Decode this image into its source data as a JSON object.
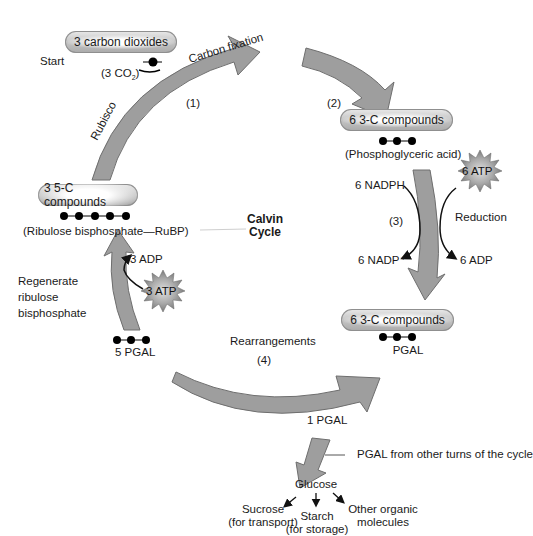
{
  "diagram": {
    "title_lines": [
      "Calvin",
      "Cycle"
    ],
    "start_label": "Start",
    "colors": {
      "arrow_fill": "#9e9e9e",
      "arrow_stroke": "#6e6e6e",
      "pill_fill": "#c8c8c8",
      "starburst_fill": "#9a9a9a",
      "text": "#1a1a1a"
    },
    "pills": [
      {
        "id": "co2",
        "label": "3 carbon dioxides"
      },
      {
        "id": "pga",
        "label": "6 3-C compounds"
      },
      {
        "id": "pgal",
        "label": "6 3-C compounds"
      },
      {
        "id": "rubp",
        "label": "3 5-C compounds"
      }
    ],
    "molecule_labels": {
      "co2": "(3 CO",
      "co2_sub": "2",
      "co2_close": ")",
      "pga": "(Phosphoglyceric acid)",
      "pgal": "PGAL",
      "rubp": "(Ribulose bisphosphate—RuBP)",
      "five_pgal": "5 PGAL",
      "one_pgal": "1 PGAL"
    },
    "steps": [
      {
        "number": "(1)",
        "name": "Carbon fixation",
        "enzyme": "Rubisco"
      },
      {
        "number": "(2)",
        "name": ""
      },
      {
        "number": "(3)",
        "name": "Reduction"
      },
      {
        "number": "(4)",
        "name": "Rearrangements"
      }
    ],
    "energy": {
      "reduction_inputs": [
        "6 NADPH",
        "6 ATP"
      ],
      "reduction_outputs": [
        "6 NADP⁺",
        "6 ADP"
      ],
      "regeneration_input": "3 ATP",
      "regeneration_output": "3 ADP"
    },
    "regenerate_label": [
      "Regenerate",
      "ribulose",
      "bisphosphate"
    ],
    "output": {
      "other_turns": "PGAL from other turns of the cycle",
      "glucose": "Glucose",
      "products": [
        {
          "name": "Sucrose",
          "note": "(for transport)"
        },
        {
          "name": "Starch",
          "note": "(for storage)"
        },
        {
          "name": "Other organic",
          "note": "molecules"
        }
      ]
    }
  }
}
